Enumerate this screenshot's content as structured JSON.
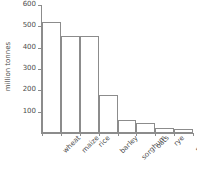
{
  "chart_data": {
    "type": "bar",
    "title": "",
    "subtitle": "",
    "xlabel": "",
    "ylabel": "million tonnes",
    "categories": [
      "wheat",
      "maize",
      "rice",
      "barley",
      "sorghum",
      "oats",
      "rye",
      "millet"
    ],
    "values": [
      520,
      455,
      455,
      180,
      62,
      45,
      23,
      17
    ],
    "ylim": [
      0,
      600
    ],
    "yticks": [
      100,
      200,
      300,
      400,
      500,
      600
    ],
    "ytick_labels": [
      "100",
      "200",
      "300",
      "400",
      "500",
      "600"
    ],
    "grid": false,
    "legend": null,
    "bar_fill_color": "#ffffff",
    "bar_edge_color": "#8c8c8c",
    "axis_color": "#8c8c8c",
    "text_color": "#4d4d4d"
  }
}
